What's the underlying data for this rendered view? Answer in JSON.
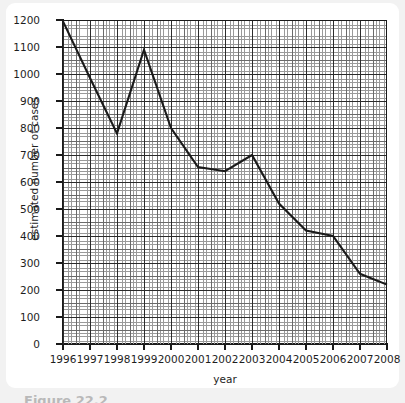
{
  "figure": {
    "caption": "Figure 22.2"
  },
  "chart_data": {
    "type": "line",
    "title": "",
    "xlabel": "year",
    "ylabel": "estimated number of cases",
    "xlim": [
      1996,
      2008
    ],
    "ylim": [
      0,
      1200
    ],
    "grid": true,
    "grid_style": "graph-paper",
    "legend": null,
    "x_ticks": [
      "1996",
      "1997",
      "1998",
      "1999",
      "2000",
      "2001",
      "2002",
      "2003",
      "2004",
      "2005",
      "2006",
      "2007",
      "2008"
    ],
    "y_ticks": [
      "0",
      "100",
      "200",
      "300",
      "400",
      "500",
      "600",
      "700",
      "800",
      "900",
      "1000",
      "1100",
      "1200"
    ],
    "x": [
      1996,
      1997,
      1998,
      1999,
      2000,
      2001,
      2002,
      2003,
      2004,
      2005,
      2006,
      2007,
      2008
    ],
    "values": [
      1195,
      985,
      780,
      1090,
      800,
      655,
      640,
      700,
      520,
      420,
      400,
      260,
      220
    ],
    "series": [
      {
        "name": "estimated number of cases",
        "color": "#1a1a1a",
        "values": [
          1195,
          985,
          780,
          1090,
          800,
          655,
          640,
          700,
          520,
          420,
          400,
          260,
          220
        ]
      }
    ]
  }
}
